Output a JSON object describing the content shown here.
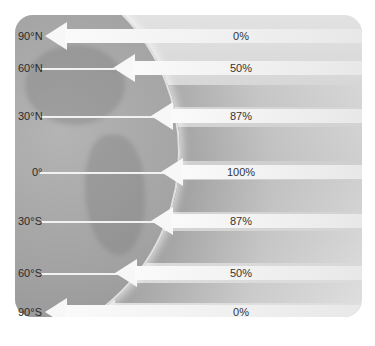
{
  "diagram": {
    "title": "",
    "latitudes": [
      {
        "label": "90°N",
        "percent": "0%",
        "y": 36
      },
      {
        "label": "60°N",
        "percent": "50%",
        "y": 68
      },
      {
        "label": "30°N",
        "percent": "87%",
        "y": 116
      },
      {
        "label": "0°",
        "percent": "100%",
        "y": 172
      },
      {
        "label": "30°S",
        "percent": "87%",
        "y": 221
      },
      {
        "label": "60°S",
        "percent": "50%",
        "y": 273
      },
      {
        "label": "90°S",
        "percent": "0%",
        "y": 312
      }
    ],
    "colors": {
      "arrow": "#f7f7f7",
      "globe": "#9a9a9a",
      "background": "#d9d9d9"
    }
  }
}
